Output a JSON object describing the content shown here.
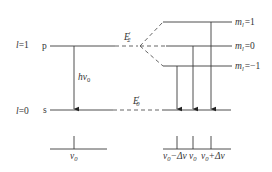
{
  "diagram": {
    "levels": {
      "upper": {
        "quantum_l": "l=1",
        "l_label": "l",
        "l_value": "=1",
        "orbital": "p"
      },
      "lower": {
        "quantum_l": "l=0",
        "l_label": "l",
        "l_value": "=0",
        "orbital": "s"
      }
    },
    "transition": {
      "label_h": "hν",
      "label_sub": "0"
    },
    "energy_labels": {
      "upper": {
        "main": "E",
        "prime": "′",
        "sub": "2"
      },
      "lower": {
        "main": "E",
        "prime": "′",
        "sub": "0"
      }
    },
    "split_levels": [
      {
        "m": "m",
        "m_sub": "l",
        "value": "=1"
      },
      {
        "m": "m",
        "m_sub": "l",
        "value": "=0"
      },
      {
        "m": "m",
        "m_sub": "l",
        "value": "=−1"
      }
    ],
    "spectrum_left": {
      "label": "ν",
      "sub": "0"
    },
    "spectrum_right": [
      {
        "label": "ν",
        "sub": "0",
        "suffix": "−Δν"
      },
      {
        "label": "ν",
        "sub": "0",
        "suffix": ""
      },
      {
        "label": "ν",
        "sub": "0",
        "suffix": "+Δν"
      }
    ],
    "colors": {
      "line": "#3a3a3a",
      "text": "#333333",
      "background": "#ffffff"
    }
  }
}
